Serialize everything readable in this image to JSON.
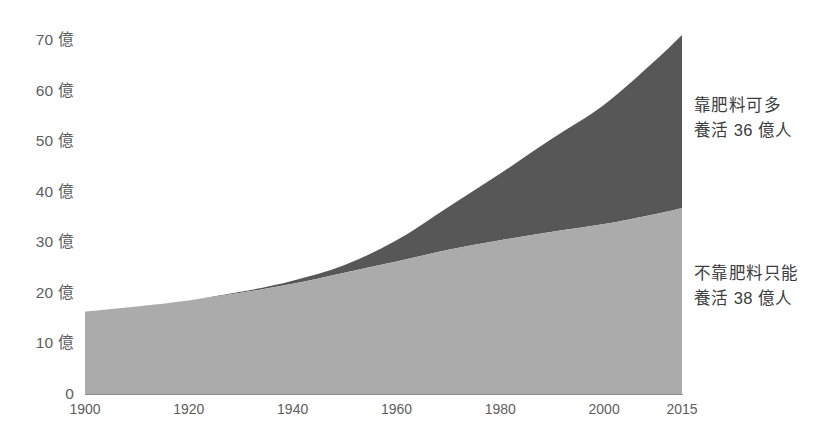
{
  "chart_data": {
    "type": "area",
    "title": "",
    "subtitle": "",
    "xlabel": "",
    "ylabel": "",
    "stacked": true,
    "grid": false,
    "legend_position": "right-inline-annotations",
    "xlim": [
      1900,
      2015
    ],
    "ylim": [
      0,
      75
    ],
    "x_ticks": [
      "1900",
      "1920",
      "1940",
      "1960",
      "1980",
      "2000",
      "2015"
    ],
    "x_tick_values": [
      1900,
      1920,
      1940,
      1960,
      1980,
      2000,
      2015
    ],
    "y_ticks": [
      "0",
      "10 億",
      "20 億",
      "30 億",
      "40 億",
      "50 億",
      "60 億",
      "70 億"
    ],
    "y_tick_values": [
      0,
      10,
      20,
      30,
      40,
      50,
      60,
      70
    ],
    "y_unit": "億",
    "x": [
      1900,
      1910,
      1920,
      1930,
      1940,
      1950,
      1960,
      1970,
      1980,
      1990,
      2000,
      2010,
      2015
    ],
    "series": [
      {
        "name": "不靠肥料只能養活",
        "color": "#ababab",
        "values": [
          16.3,
          17.3,
          18.5,
          20.0,
          21.8,
          24.0,
          26.2,
          28.5,
          30.4,
          32.1,
          33.6,
          35.6,
          36.8
        ]
      },
      {
        "name": "靠肥料可多養活",
        "color": "#575757",
        "values": [
          0.0,
          0.0,
          0.0,
          0.2,
          0.6,
          1.5,
          4.2,
          8.5,
          13.2,
          18.4,
          23.6,
          30.5,
          34.2
        ]
      }
    ],
    "totals": [
      16.3,
      17.3,
      18.5,
      20.2,
      22.4,
      25.5,
      30.4,
      37.0,
      43.6,
      50.5,
      57.2,
      66.1,
      71.0
    ],
    "annotations": [
      {
        "name": "upper",
        "lines": [
          "靠肥料可多",
          "養活 36 億人"
        ],
        "value": 36,
        "unit": "億人",
        "color": "#575757"
      },
      {
        "name": "lower",
        "lines": [
          "不靠肥料只能",
          "養活 38 億人"
        ],
        "value": 38,
        "unit": "億人",
        "color": "#ababab"
      }
    ]
  },
  "axis": {
    "y_labels": [
      {
        "text": "70 億",
        "value": 70
      },
      {
        "text": "60 億",
        "value": 60
      },
      {
        "text": "50 億",
        "value": 50
      },
      {
        "text": "40 億",
        "value": 40
      },
      {
        "text": "30 億",
        "value": 30
      },
      {
        "text": "20 億",
        "value": 20
      },
      {
        "text": "10 億",
        "value": 10
      },
      {
        "text": "0",
        "value": 0
      }
    ],
    "x_labels": [
      {
        "text": "1900",
        "value": 1900
      },
      {
        "text": "1920",
        "value": 1920
      },
      {
        "text": "1940",
        "value": 1940
      },
      {
        "text": "1960",
        "value": 1960
      },
      {
        "text": "1980",
        "value": 1980
      },
      {
        "text": "2000",
        "value": 2000
      },
      {
        "text": "2015",
        "value": 2015
      }
    ],
    "line_color": "#8d8f91"
  },
  "annotations": {
    "upper": {
      "line1": "靠肥料可多",
      "line2": "養活 36 億人"
    },
    "lower": {
      "line1": "不靠肥料只能",
      "line2": "養活 38 億人"
    }
  },
  "colors": {
    "background": "#ffffff",
    "lower_area": "#ababab",
    "upper_area": "#575757",
    "axis": "#8d8f91",
    "tick_text": "#5d5e60",
    "annotation_text": "#3b3c3e"
  }
}
